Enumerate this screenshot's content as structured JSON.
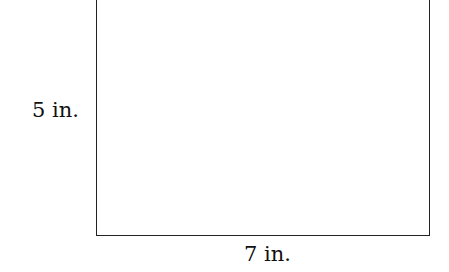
{
  "diagram": {
    "shape": "rectangle",
    "height_label": "5 in.",
    "width_label": "7 in."
  }
}
